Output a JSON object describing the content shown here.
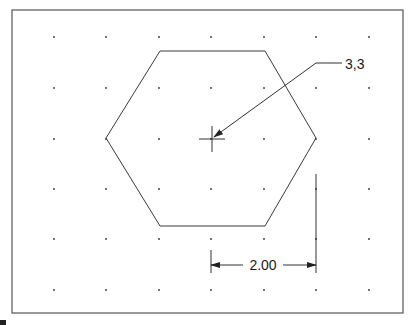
{
  "drawing": {
    "type": "technical-drawing",
    "subject": "hexagon with center point label and dimension",
    "colors": {
      "background": "#ffffff",
      "line": "#3a3a3a",
      "border": "#555555",
      "grid_dot": "#333333"
    },
    "frame": {
      "x": 12,
      "y": 10,
      "width": 391,
      "height": 303
    },
    "grid": {
      "columns_x": [
        54,
        106,
        159,
        211,
        264,
        316,
        369
      ],
      "rows_y": [
        37,
        88,
        139,
        189,
        239,
        290
      ]
    },
    "hexagon": {
      "points": [
        [
          160,
          51
        ],
        [
          265,
          51
        ],
        [
          316,
          138
        ],
        [
          265,
          226
        ],
        [
          160,
          226
        ],
        [
          106,
          138
        ]
      ]
    },
    "center_mark": {
      "x": 212,
      "y": 139,
      "half_size": 13
    },
    "leader": {
      "label": "3,3",
      "points": [
        [
          214,
          137
        ],
        [
          316,
          63
        ],
        [
          342,
          63
        ]
      ],
      "text_x": 345,
      "text_y": 69
    },
    "dimension": {
      "label": "2.00",
      "ext_left": {
        "x": 211,
        "y1": 250,
        "y2": 273
      },
      "ext_right": {
        "x": 316,
        "y1": 174,
        "y2": 273
      },
      "line_y": 265,
      "text_x": 263,
      "text_y": 270
    }
  }
}
